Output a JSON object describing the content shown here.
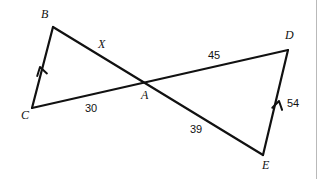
{
  "figure": {
    "type": "geometry-diagram",
    "background_color": "#ffffff",
    "stroke_color": "#111111",
    "vertices": [
      {
        "id": "B",
        "label": "B",
        "x": 53,
        "y": 27,
        "label_x": 41,
        "label_y": 8
      },
      {
        "id": "C",
        "label": "C",
        "x": 32,
        "y": 108,
        "label_x": 21,
        "label_y": 109
      },
      {
        "id": "A",
        "label": "A",
        "x": 148,
        "y": 84,
        "label_x": 141,
        "label_y": 89
      },
      {
        "id": "D",
        "label": "D",
        "x": 288,
        "y": 50,
        "label_x": 285,
        "label_y": 29
      },
      {
        "id": "E",
        "label": "E",
        "x": 263,
        "y": 155,
        "label_x": 262,
        "label_y": 159
      }
    ],
    "segments": [
      {
        "id": "BC",
        "from": "B",
        "to": "C",
        "tick_marks": 1
      },
      {
        "id": "BE",
        "from": "B",
        "to": "E",
        "tick_marks": 0
      },
      {
        "id": "CD",
        "from": "C",
        "to": "D",
        "tick_marks": 0
      },
      {
        "id": "DE",
        "from": "D",
        "to": "E",
        "tick_marks": 1
      }
    ],
    "tick_marks": [
      {
        "id": "tick-bc",
        "segment": "BC",
        "x": 40,
        "y": 67,
        "angle_deg": 255
      },
      {
        "id": "tick-de",
        "segment": "DE",
        "x": 279,
        "y": 101,
        "angle_deg": 283
      }
    ],
    "measure_labels": [
      {
        "id": "label-x",
        "text": "X",
        "x": 98,
        "y": 38,
        "style": "variable",
        "segment": "BA"
      },
      {
        "id": "label-30",
        "text": "30",
        "x": 85,
        "y": 103,
        "style": "number",
        "segment": "CA"
      },
      {
        "id": "label-45",
        "text": "45",
        "x": 208,
        "y": 50,
        "style": "number",
        "segment": "AD"
      },
      {
        "id": "label-39",
        "text": "39",
        "x": 190,
        "y": 124,
        "style": "number",
        "segment": "AE"
      },
      {
        "id": "label-54",
        "text": "54",
        "x": 287,
        "y": 98,
        "style": "number",
        "segment": "DE"
      }
    ],
    "border": {
      "present": true,
      "color": "#b9b9b9",
      "side": "right"
    }
  }
}
